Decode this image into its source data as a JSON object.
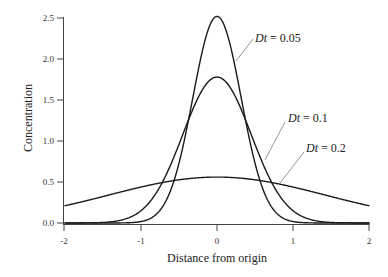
{
  "chart_data": {
    "type": "line",
    "title": "",
    "xlabel": "Distance from origin",
    "ylabel": "Concentration",
    "xlim": [
      -2,
      2
    ],
    "ylim": [
      0,
      2.5
    ],
    "grid": false,
    "legend": "none (inline annotations with leader lines)",
    "x_ticks": [
      "-2",
      "-1",
      "0",
      "1",
      "2"
    ],
    "y_ticks": [
      "0.0",
      "0.5",
      "1.0",
      "1.5",
      "2.0",
      "2.5"
    ],
    "x": [
      -2,
      -1.75,
      -1.5,
      -1.25,
      -1,
      -0.75,
      -0.5,
      -0.25,
      0,
      0.25,
      0.5,
      0.75,
      1,
      1.25,
      1.5,
      1.75,
      2
    ],
    "series": [
      {
        "name": "Dt = 0.05",
        "peak": 2.52,
        "values": [
          0.0,
          0.0,
          0.0,
          0.0,
          0.02,
          0.15,
          0.72,
          1.83,
          2.52,
          1.83,
          0.72,
          0.15,
          0.02,
          0.0,
          0.0,
          0.0,
          0.0
        ]
      },
      {
        "name": "Dt = 0.1",
        "peak": 1.78,
        "values": [
          0.0,
          0.0,
          0.0,
          0.04,
          0.15,
          0.43,
          0.95,
          1.52,
          1.78,
          1.52,
          0.95,
          0.43,
          0.15,
          0.04,
          0.0,
          0.0,
          0.0
        ]
      },
      {
        "name": "Dt = 0.2",
        "peak": 0.56,
        "values": [
          0.21,
          0.26,
          0.32,
          0.38,
          0.44,
          0.49,
          0.53,
          0.55,
          0.56,
          0.55,
          0.53,
          0.49,
          0.44,
          0.38,
          0.32,
          0.26,
          0.21
        ]
      }
    ],
    "annotations": [
      {
        "text_var": "Dt",
        "text_eq": " = 0.05",
        "series": "Dt = 0.05"
      },
      {
        "text_var": "Dt",
        "text_eq": " = 0.1",
        "series": "Dt = 0.1"
      },
      {
        "text_var": "Dt",
        "text_eq": " = 0.2",
        "series": "Dt = 0.2"
      }
    ]
  }
}
